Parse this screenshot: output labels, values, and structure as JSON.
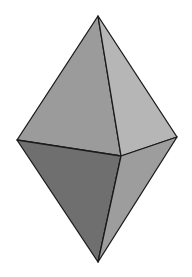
{
  "figure": {
    "type": "bipyramid",
    "background": "#ffffff",
    "edge_color": "#1a1a1a",
    "vertices": {
      "top": [
        98,
        16
      ],
      "left": [
        17,
        140
      ],
      "front": [
        121,
        156
      ],
      "right": [
        177,
        137
      ],
      "bottom": [
        98,
        262
      ]
    },
    "faces": [
      {
        "name": "upper-left-face",
        "points": "98,16 17,140 121,156",
        "fill": "#9b9b9b"
      },
      {
        "name": "upper-right-face",
        "points": "98,16 121,156 177,137",
        "fill": "#b6b6b6"
      },
      {
        "name": "lower-left-face",
        "points": "17,140 121,156 98,262",
        "fill": "#6f6f6f"
      },
      {
        "name": "lower-right-face",
        "points": "121,156 177,137 98,262",
        "fill": "#9d9d9d"
      }
    ]
  }
}
